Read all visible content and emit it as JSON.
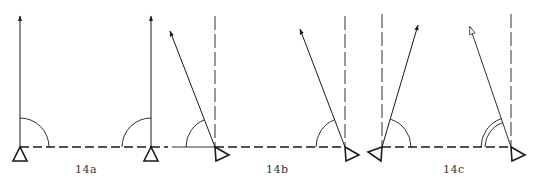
{
  "diagram": {
    "ink_color": "#1a1a1a",
    "label_color": "#333333",
    "figures": [
      {
        "label": "14a",
        "label_pos": [
          84,
          172
        ],
        "description": "Both arrows vertical; right angles at both stations",
        "left_station": {
          "pivot": [
            20,
            147
          ],
          "arrow_tip": [
            20,
            16
          ],
          "arrowhead": "filled",
          "arc": "single",
          "triangle": "up"
        },
        "right_station": {
          "pivot": [
            151,
            147
          ],
          "arrow_tip": [
            151,
            16
          ],
          "arrowhead": "filled",
          "arc": "single",
          "triangle": "up"
        },
        "reference_verticals": false
      },
      {
        "label": "14b",
        "label_pos": [
          274,
          172
        ],
        "description": "Both arrows tilted left of vertical; equal angles",
        "left_station": {
          "pivot": [
            215,
            147
          ],
          "arrow_tip": [
            170,
            31
          ],
          "arrowhead": "filled",
          "arc": "single",
          "triangle": "rotated-right"
        },
        "right_station": {
          "pivot": [
            345,
            147
          ],
          "arrow_tip": [
            300,
            29
          ],
          "arrowhead": "filled",
          "arc": "single",
          "triangle": "rotated-right"
        },
        "reference_verticals": true
      },
      {
        "label": "14c",
        "label_pos": [
          451,
          172
        ],
        "description": "Arrows converge; left arrow tilted right, right arrow tilted left with double arc",
        "left_station": {
          "pivot": [
            382,
            147
          ],
          "arrow_tip": [
            418,
            25
          ],
          "arrowhead": "filled",
          "arc": "single",
          "triangle": "rotated-left"
        },
        "right_station": {
          "pivot": [
            511,
            147
          ],
          "arrow_tip": [
            470,
            27
          ],
          "arrowhead": "open",
          "arc": "double",
          "triangle": "rotated-right"
        },
        "reference_verticals": true
      }
    ]
  }
}
